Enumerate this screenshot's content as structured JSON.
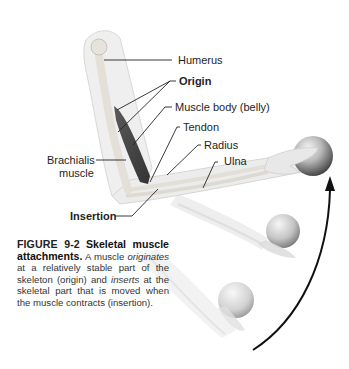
{
  "figure": {
    "labels": {
      "humerus": "Humerus",
      "origin": "Origin",
      "muscle_body": "Muscle body (belly)",
      "tendon": "Tendon",
      "radius": "Radius",
      "ulna": "Ulna",
      "brachialis_line1": "Brachialis",
      "brachialis_line2": "muscle",
      "insertion": "Insertion"
    },
    "caption": {
      "figure_number": "FIGURE 9-2",
      "title": "Skeletal muscle attachments.",
      "text_1": "A muscle",
      "em_1": "originates",
      "text_2": "at a relatively stable part of the skeleton (origin) and",
      "em_2": "inserts",
      "text_3": "at the skeletal part that is moved when the muscle contracts (insertion)."
    },
    "colors": {
      "muscle": "#4a4a4a",
      "bone": "#e6e3dc",
      "skin": "#efefef",
      "arrow": "#111111",
      "leader_lines": "#222222"
    }
  }
}
